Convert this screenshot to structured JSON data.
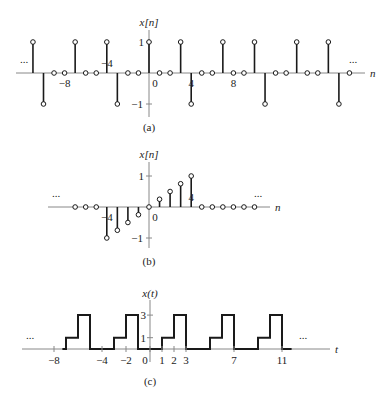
{
  "figure": {
    "panels": [
      {
        "id": "a",
        "caption": "(a)",
        "ylabel": "x[n]",
        "xlabel": "n",
        "ellipsis_left": "...",
        "ellipsis_right": "...",
        "xticks": [
          {
            "value": -8,
            "label": "−8"
          },
          {
            "value": -4,
            "label": "−4"
          },
          {
            "value": 0,
            "label": "0"
          },
          {
            "value": 4,
            "label": "4"
          },
          {
            "value": 8,
            "label": "8"
          }
        ],
        "yticks": [
          {
            "value": 1,
            "label": "1"
          },
          {
            "value": -1,
            "label": "−1"
          }
        ]
      },
      {
        "id": "b",
        "caption": "(b)",
        "ylabel": "x[n]",
        "xlabel": "n",
        "ellipsis_left": "...",
        "ellipsis_right": "...",
        "xticks": [
          {
            "value": -4,
            "label": "−4"
          },
          {
            "value": 0,
            "label": "0"
          },
          {
            "value": 4,
            "label": "4"
          }
        ],
        "yticks": [
          {
            "value": 1,
            "label": "1"
          },
          {
            "value": -1,
            "label": "−1"
          }
        ]
      },
      {
        "id": "c",
        "caption": "(c)",
        "ylabel": "x(t)",
        "xlabel": "t",
        "ellipsis_left": "...",
        "ellipsis_right": "...",
        "xticks": [
          {
            "value": -8,
            "label": "−8"
          },
          {
            "value": -4,
            "label": "−4"
          },
          {
            "value": -2,
            "label": "−2"
          },
          {
            "value": 0,
            "label": "0"
          },
          {
            "value": 1,
            "label": "1"
          },
          {
            "value": 2,
            "label": "2"
          },
          {
            "value": 3,
            "label": "3"
          },
          {
            "value": 7,
            "label": "7"
          },
          {
            "value": 11,
            "label": "11"
          }
        ],
        "yticks": [
          {
            "value": 3,
            "label": "3"
          },
          {
            "value": 1,
            "label": "1"
          }
        ]
      }
    ]
  },
  "chart_data": [
    {
      "type": "stem",
      "title": "(a)",
      "xlabel": "n",
      "ylabel": "x[n]",
      "periodic": true,
      "period": 7,
      "n": [
        -12,
        -11,
        -10,
        -9,
        -8,
        -7,
        -6,
        -5,
        -4,
        -3,
        -2,
        -1,
        0,
        1,
        2,
        3,
        4,
        5,
        6,
        7,
        8,
        9,
        10,
        11,
        12,
        13,
        14,
        15,
        16,
        17,
        18,
        19
      ],
      "values": [
        0,
        1,
        -1,
        0,
        0,
        1,
        0,
        0,
        1,
        -1,
        0,
        0,
        1,
        0,
        0,
        1,
        -1,
        0,
        0,
        1,
        0,
        0,
        1,
        -1,
        0,
        0,
        1,
        0,
        0,
        1,
        -1,
        0
      ],
      "ylim": [
        -1,
        1
      ]
    },
    {
      "type": "stem",
      "title": "(b)",
      "xlabel": "n",
      "ylabel": "x[n]",
      "periodic": false,
      "n": [
        -7,
        -6,
        -5,
        -4,
        -3,
        -2,
        -1,
        0,
        1,
        2,
        3,
        4,
        5,
        6,
        7,
        8,
        9,
        10
      ],
      "values": [
        0,
        0,
        0,
        -1,
        -0.75,
        -0.5,
        -0.25,
        0,
        0.25,
        0.5,
        0.75,
        1,
        0,
        0,
        0,
        0,
        0,
        0
      ],
      "ylim": [
        -1,
        1
      ]
    },
    {
      "type": "line",
      "title": "(c)",
      "xlabel": "t",
      "ylabel": "x(t)",
      "periodic": true,
      "period": 4,
      "one_period": [
        {
          "t_start": 0,
          "t_end": 1,
          "value": 0
        },
        {
          "t_start": 1,
          "t_end": 2,
          "value": 1
        },
        {
          "t_start": 2,
          "t_end": 3,
          "value": 3
        },
        {
          "t_start": 3,
          "t_end": 4,
          "value": 0
        }
      ],
      "xlim": [
        -9,
        12
      ],
      "ylim": [
        0,
        3
      ]
    }
  ]
}
